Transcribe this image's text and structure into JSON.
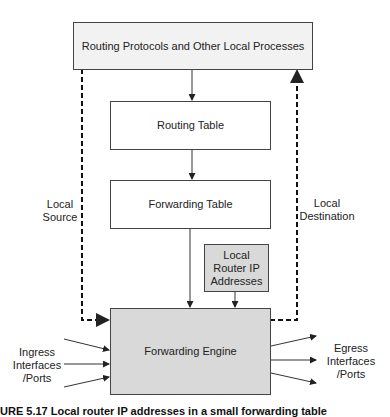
{
  "diagram": {
    "boxes": {
      "routing_protocols": "Routing Protocols and Other Local Processes",
      "routing_table": "Routing Table",
      "forwarding_table": "Forwarding Table",
      "local_router_ip": "Local Router IP Addresses",
      "forwarding_engine": "Forwarding Engine"
    },
    "labels": {
      "local_source": "Local Source",
      "local_destination": "Local Destination",
      "ingress": "Ingress Interfaces /Ports",
      "egress": "Egress Interfaces /Ports"
    },
    "caption": "URE 5.17  Local router IP addresses in a small forwarding table"
  },
  "colors": {
    "top_box_fill": "#f2f2f2",
    "table_fill": "#ffffff",
    "gray_fill": "#d9d9d9",
    "stroke": "#333333"
  }
}
